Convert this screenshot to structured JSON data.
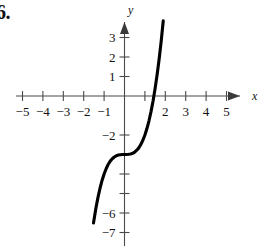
{
  "figure": {
    "problem_number": "6.",
    "axis_labels": {
      "x": "x",
      "y": "y"
    }
  },
  "chart_data": {
    "type": "line",
    "title": "",
    "subtitle": "",
    "xlabel": "x",
    "ylabel": "y",
    "xlim": [
      -5.6,
      5.6
    ],
    "ylim": [
      -7.6,
      3.9
    ],
    "grid": false,
    "legend": null,
    "axes_style": "cartesian-arrows",
    "x_ticks": [
      -5,
      -4,
      -3,
      -2,
      -1,
      1,
      2,
      3,
      4,
      5
    ],
    "x_tick_labels": [
      "−5",
      "−4",
      "−3",
      "−2",
      "−1",
      "",
      "2",
      "3",
      "4",
      "5"
    ],
    "y_ticks": [
      3,
      2,
      1,
      -2,
      -3,
      -4,
      -5,
      -6,
      -7
    ],
    "y_tick_labels": [
      "3",
      "2",
      "1",
      "−2",
      "",
      "",
      "",
      "−6",
      "−7"
    ],
    "series": [
      {
        "name": "cubic",
        "equation": "y = x^3 - 3",
        "color": "#000000",
        "x": [
          -1.52,
          -1.4,
          -1.3,
          -1.2,
          -1.1,
          -1.0,
          -0.9,
          -0.8,
          -0.7,
          -0.6,
          -0.5,
          -0.4,
          -0.3,
          -0.2,
          -0.1,
          0.0,
          0.1,
          0.2,
          0.3,
          0.4,
          0.5,
          0.6,
          0.7,
          0.8,
          0.9,
          1.0,
          1.1,
          1.2,
          1.3,
          1.4,
          1.5,
          1.6,
          1.7,
          1.8,
          1.9
        ],
        "y": [
          -6.51,
          -5.74,
          -5.2,
          -4.73,
          -4.33,
          -4.0,
          -3.73,
          -3.51,
          -3.34,
          -3.22,
          -3.13,
          -3.06,
          -3.03,
          -3.01,
          -3.0,
          -3.0,
          -3.0,
          -2.99,
          -2.97,
          -2.94,
          -2.88,
          -2.78,
          -2.66,
          -2.49,
          -2.27,
          -2.0,
          -1.67,
          -1.27,
          -0.8,
          -0.26,
          0.38,
          1.1,
          1.91,
          2.83,
          3.86
        ]
      }
    ],
    "annotations": [
      {
        "text": "inflection point",
        "x": 0,
        "y": -3
      },
      {
        "text": "x-intercept",
        "x": 1.442,
        "y": 0
      },
      {
        "text": "y-intercept",
        "x": 0,
        "y": -3
      }
    ]
  }
}
